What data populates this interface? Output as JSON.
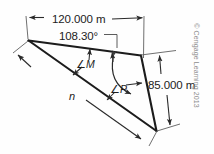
{
  "figure": {
    "type": "geometry-diagram",
    "dimensions": {
      "top_side": "120.000 m",
      "right_side": "85.000 m",
      "long_side_variable": "n"
    },
    "angles": {
      "apex_angle_value": "108.30°",
      "angle_m": "∠M",
      "angle_m_symbol": "∠",
      "angle_m_name": "M",
      "angle_p": "∠P",
      "angle_p_symbol": "∠",
      "angle_p_name": "P"
    },
    "credit": "© Cengage Learning 2013",
    "colors": {
      "line": "#1c1c1c",
      "dimension_line": "#6b6b6b",
      "background": "#fefefe",
      "credit_text": "#8d8d8d"
    }
  }
}
